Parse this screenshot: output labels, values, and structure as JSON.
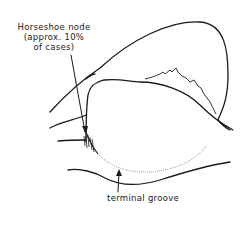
{
  "labels": {
    "horseshoe_node_line1": "Horseshoe node",
    "horseshoe_node_line2": "(approx. 10%",
    "horseshoe_node_line3": "of cases)",
    "terminal_groove": "terminal groove"
  },
  "colors": {
    "line": "#1a1a1a",
    "background": "#ffffff",
    "dotted": "#8a8a8a"
  }
}
